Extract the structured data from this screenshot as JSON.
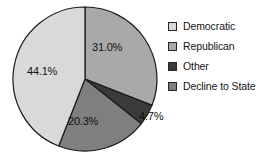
{
  "chart_data": {
    "type": "pie",
    "title": "",
    "labels": [
      "Republican",
      "Other",
      "Decline to State",
      "Democratic"
    ],
    "values": [
      31.0,
      4.7,
      20.3,
      44.1
    ],
    "value_labels": [
      "31.0%",
      "4.7%",
      "20.3%",
      "44.1%"
    ],
    "colors": [
      "#a9a9a9",
      "#3b3b3b",
      "#7f7f7f",
      "#d9d9d9"
    ],
    "units": "percent",
    "start_angle_deg": 0,
    "direction": "clockwise",
    "legend_position": "right",
    "grid": false,
    "outline_color": "#1a1a1a"
  },
  "legend": {
    "items": [
      {
        "label": "Democratic",
        "color": "#d9d9d9"
      },
      {
        "label": "Republican",
        "color": "#a9a9a9"
      },
      {
        "label": "Other",
        "color": "#3b3b3b"
      },
      {
        "label": "Decline to State",
        "color": "#7f7f7f"
      }
    ]
  }
}
